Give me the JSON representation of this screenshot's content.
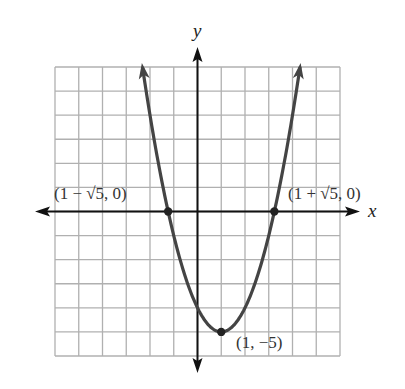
{
  "chart_data": {
    "type": "line",
    "title": "",
    "function": "y = (x - 1)^2 - 5",
    "xlabel": "x",
    "ylabel": "y",
    "xlim": [
      -6,
      6
    ],
    "ylim": [
      -6,
      6
    ],
    "grid": true,
    "grid_step": 1,
    "legend": null,
    "series": [
      {
        "name": "parabola",
        "x": [
          -2.317,
          -2,
          -1.5,
          -1.236,
          -1,
          -0.5,
          0,
          0.5,
          1,
          1.5,
          2,
          2.5,
          3,
          3.236,
          3.5,
          4,
          4.317
        ],
        "y": [
          6,
          4,
          1.25,
          0,
          -1,
          -2.75,
          -4,
          -4.75,
          -5,
          -4.75,
          -4,
          -2.75,
          -1,
          0,
          1.25,
          4,
          6
        ]
      }
    ],
    "points": [
      {
        "x": -1.236,
        "y": 0,
        "label": "(1 − √5, 0)"
      },
      {
        "x": 3.236,
        "y": 0,
        "label": "(1 + √5, 0)"
      },
      {
        "x": 1,
        "y": -5,
        "label": "(1, −5)"
      }
    ],
    "annotations": [
      "(1 − √5, 0)",
      "(1 + √5, 0)",
      "(1, −5)"
    ]
  },
  "labels": {
    "x_axis": "x",
    "y_axis": "y",
    "left_root": "(1 − √5, 0)",
    "right_root": "(1 + √5, 0)",
    "vertex": "(1, −5)"
  },
  "colors": {
    "grid": "#b0b0b0",
    "axes": "#111111",
    "curve": "#444444",
    "points": "#222222"
  }
}
